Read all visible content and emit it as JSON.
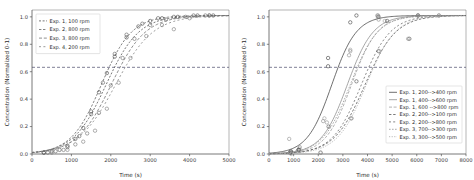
{
  "figure": {
    "background": "#ffffff",
    "axis_color": "#555555",
    "refline_color": "#4a4a6a",
    "refline_value": 0.632
  },
  "chart_data": [
    {
      "id": "left",
      "type": "line",
      "title": "",
      "xlabel": "Time (s)",
      "ylabel": "Concentration (Normalized 0-1)",
      "xlim": [
        0,
        5000
      ],
      "ylim": [
        0.0,
        1.05
      ],
      "xticks": [
        0,
        1000,
        2000,
        3000,
        4000,
        5000
      ],
      "xticklabels": [
        "0",
        "1000",
        "2000",
        "3000",
        "4000",
        "5000"
      ],
      "yticks": [
        0.0,
        0.2,
        0.4,
        0.6,
        0.8,
        1.0
      ],
      "yticklabels": [
        "0.0",
        "0.2",
        "0.4",
        "0.6",
        "0.8",
        "1.0"
      ],
      "grid": false,
      "legend_position": "upper left",
      "annotations": [
        {
          "kind": "hline",
          "y": 0.632,
          "style": "dashed",
          "color": "#4a4a6a"
        }
      ],
      "series": [
        {
          "name": "Exp. 1, 100 rpm",
          "color": "#4a4a4a",
          "dash": "2,1.6",
          "marker": "o",
          "fit": {
            "kind": "logistic",
            "t50": 1880,
            "k": 0.0024,
            "ymax": 1.01
          },
          "points_x": [
            300,
            500,
            700,
            900,
            1100,
            1300,
            1500,
            1700,
            1900,
            2100,
            2400,
            2700,
            3000,
            3300,
            3700,
            4200,
            4600
          ],
          "points_y": [
            0.01,
            0.02,
            0.03,
            0.06,
            0.11,
            0.19,
            0.31,
            0.45,
            0.59,
            0.71,
            0.85,
            0.93,
            0.97,
            0.99,
            1.0,
            1.01,
            1.01
          ]
        },
        {
          "name": "Exp. 2, 800 rpm",
          "color": "#5a5a5a",
          "dash": "2.4,1.6",
          "marker": "o",
          "fit": {
            "kind": "logistic",
            "t50": 1760,
            "k": 0.0026,
            "ymax": 1.01
          },
          "points_x": [
            300,
            600,
            900,
            1200,
            1500,
            1800,
            2100,
            2400,
            2800,
            3200,
            3600,
            4100,
            4500
          ],
          "points_y": [
            0.01,
            0.02,
            0.05,
            0.13,
            0.29,
            0.52,
            0.73,
            0.87,
            0.95,
            0.99,
            1.0,
            1.01,
            1.01
          ]
        },
        {
          "name": "Exp. 3, 800 rpm",
          "color": "#6a6a6a",
          "dash": "3,1.8",
          "marker": "o",
          "fit": {
            "kind": "logistic",
            "t50": 2010,
            "k": 0.0023,
            "ymax": 1.01
          },
          "points_x": [
            400,
            800,
            1100,
            1400,
            1700,
            2000,
            2300,
            2600,
            3000,
            3400,
            3900,
            4400
          ],
          "points_y": [
            0.01,
            0.03,
            0.07,
            0.15,
            0.3,
            0.5,
            0.7,
            0.84,
            0.94,
            0.98,
            1.0,
            1.01
          ]
        },
        {
          "name": "Exp. 4, 200 rpm",
          "color": "#7a7a7a",
          "dash": "2,2.4",
          "marker": "o",
          "fit": {
            "kind": "logistic",
            "t50": 2120,
            "k": 0.0021,
            "ymax": 1.01
          },
          "points_x": [
            500,
            900,
            1300,
            1600,
            1900,
            2200,
            2500,
            2900,
            3300,
            3600,
            4000,
            4500
          ],
          "points_y": [
            0.01,
            0.03,
            0.09,
            0.17,
            0.33,
            0.52,
            0.7,
            0.86,
            0.94,
            0.91,
            0.99,
            1.01
          ]
        }
      ],
      "legend": [
        {
          "label": "Exp. 1, 100 rpm",
          "color": "#4a4a4a",
          "dash": "2,1.6"
        },
        {
          "label": "Exp. 2, 800 rpm",
          "color": "#5a5a5a",
          "dash": "2.4,1.6"
        },
        {
          "label": "Exp. 3, 800 rpm",
          "color": "#6a6a6a",
          "dash": "3,1.8"
        },
        {
          "label": "Exp. 4, 200 rpm",
          "color": "#7a7a7a",
          "dash": "2,2.4"
        }
      ]
    },
    {
      "id": "right",
      "type": "line",
      "title": "",
      "xlabel": "Time (s)",
      "ylabel": "Concentration (Normalized 0-1)",
      "xlim": [
        0,
        8000
      ],
      "ylim": [
        0.0,
        1.05
      ],
      "xticks": [
        0,
        1000,
        2000,
        3000,
        4000,
        5000,
        6000,
        7000,
        8000
      ],
      "xticklabels": [
        "0",
        "1000",
        "2000",
        "3000",
        "4000",
        "5000",
        "6000",
        "7000",
        "8000"
      ],
      "yticks": [
        0.0,
        0.2,
        0.4,
        0.6,
        0.8,
        1.0
      ],
      "yticklabels": [
        "0.0",
        "0.2",
        "0.4",
        "0.6",
        "0.8",
        "1.0"
      ],
      "grid": false,
      "legend_position": "lower right",
      "annotations": [
        {
          "kind": "hline",
          "y": 0.632,
          "style": "dashed",
          "color": "#4a4a6a"
        }
      ],
      "series": [
        {
          "name": "Exp. 1, 200-->400 rpm",
          "color": "#3f3f3f",
          "dash": "none",
          "marker": "o",
          "fit": {
            "kind": "logistic",
            "t50": 2550,
            "k": 0.002,
            "ymax": 1.01
          },
          "points_x": [
            850,
            1200,
            2400,
            2400,
            3300,
            3550
          ],
          "points_y": [
            0.01,
            0.03,
            0.7,
            0.64,
            0.96,
            1.01
          ]
        },
        {
          "name": "Exp. 1, 400-->600 rpm",
          "color": "#8a8a8a",
          "dash": "none",
          "marker": "o",
          "fit": {
            "kind": "logistic",
            "t50": 3180,
            "k": 0.0019,
            "ymax": 1.01
          },
          "points_x": [
            900,
            1250,
            2200,
            3250,
            4400,
            4450
          ],
          "points_y": [
            0.02,
            0.05,
            0.24,
            0.72,
            1.01,
            0.98
          ]
        },
        {
          "name": "Exp. 1, 600 -->800 rpm",
          "color": "#9a9a9a",
          "dash": "3,1.6",
          "marker": "o",
          "fit": {
            "kind": "logistic",
            "t50": 3350,
            "k": 0.0019,
            "ymax": 1.01
          },
          "points_x": [
            880,
            1230,
            2250,
            3300,
            4420,
            4700
          ],
          "points_y": [
            0.02,
            0.04,
            0.26,
            0.76,
            1.0,
            0.97
          ]
        },
        {
          "name": "Exp. 2, 200-->100 rpm",
          "color": "#4f4f4f",
          "dash": "2.4,1.8",
          "marker": "o",
          "fit": {
            "kind": "logistic",
            "t50": 3900,
            "k": 0.0016,
            "ymax": 1.01
          },
          "points_x": [
            900,
            1220,
            2420,
            3550,
            4450,
            4800,
            5700,
            6050
          ],
          "points_y": [
            0.01,
            0.03,
            0.2,
            0.53,
            0.75,
            0.97,
            0.84,
            1.01
          ]
        },
        {
          "name": "Exp. 2, 200-->800 rpm",
          "color": "#5f5f5f",
          "dash": "2,2.2",
          "marker": "o",
          "fit": {
            "kind": "logistic",
            "t50": 3750,
            "k": 0.0017,
            "ymax": 1.01
          },
          "points_x": [
            880,
            1200,
            2100,
            3350,
            4450,
            6050,
            6900
          ],
          "points_y": [
            0.02,
            0.03,
            0.01,
            0.26,
            1.0,
            1.01,
            1.01
          ]
        },
        {
          "name": "Exp. 3, 700-->300 rpm",
          "color": "#8f8f8f",
          "dash": "1.6,1.4",
          "marker": "o",
          "fit": {
            "kind": "logistic",
            "t50": 3300,
            "k": 0.0018,
            "ymax": 1.01
          },
          "points_x": [
            820,
            1150,
            2350,
            3300,
            4430,
            5650
          ],
          "points_y": [
            0.11,
            0.02,
            0.23,
            0.75,
            1.01,
            0.84
          ]
        },
        {
          "name": "Exp. 3, 300-->500 rpm",
          "color": "#a5a5a5",
          "dash": "1.2,1.4",
          "marker": "o",
          "fit": {
            "kind": "logistic",
            "t50": 3950,
            "k": 0.0017,
            "ymax": 1.01
          },
          "points_x": [
            900,
            1250,
            2080,
            3320,
            4480,
            6050,
            6900
          ],
          "points_y": [
            0.0,
            0.02,
            0.01,
            0.26,
            0.75,
            1.01,
            1.01
          ]
        }
      ],
      "legend": [
        {
          "label": "Exp. 1, 200-->400 rpm",
          "color": "#3f3f3f",
          "dash": "none"
        },
        {
          "label": "Exp. 1, 400-->600 rpm",
          "color": "#8a8a8a",
          "dash": "none"
        },
        {
          "label": "Exp. 1, 600 -->800 rpm",
          "color": "#9a9a9a",
          "dash": "3,1.6"
        },
        {
          "label": "Exp. 2, 200-->100 rpm",
          "color": "#4f4f4f",
          "dash": "2.4,1.8"
        },
        {
          "label": "Exp. 2, 200-->800 rpm",
          "color": "#5f5f5f",
          "dash": "2,2.2"
        },
        {
          "label": "Exp. 3, 700-->300 rpm",
          "color": "#8f8f8f",
          "dash": "1.6,1.4"
        },
        {
          "label": "Exp. 3, 300-->500 rpm",
          "color": "#a5a5a5",
          "dash": "1.2,1.4"
        }
      ]
    }
  ]
}
